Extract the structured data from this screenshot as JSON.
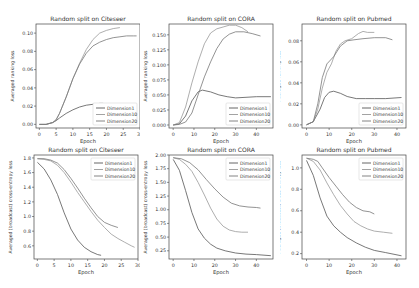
{
  "figure": {
    "line_colors": [
      "#555555",
      "#999999",
      "#777777"
    ]
  },
  "chart_data": [
    {
      "type": "line",
      "title": "Random split on Citeseer",
      "xlabel": "Epoch",
      "ylabel": "Averaged ranking loss",
      "xlim": [
        -1,
        30
      ],
      "ylim": [
        -0.004,
        0.11
      ],
      "xticks": [
        0,
        5,
        10,
        15,
        20,
        25,
        30
      ],
      "yticks": [
        0.0,
        0.02,
        0.04,
        0.06,
        0.08,
        0.1
      ],
      "ytick_labels": [
        "0.00",
        "0.02",
        "0.04",
        "0.06",
        "0.08",
        "0.10"
      ],
      "legend_position": "lower right",
      "series": [
        {
          "name": "Dimension1",
          "x": [
            0,
            2,
            4,
            5,
            6,
            8,
            10,
            12,
            14,
            16,
            18,
            19
          ],
          "y": [
            0,
            0,
            0.002,
            0.004,
            0.007,
            0.012,
            0.016,
            0.019,
            0.021,
            0.022,
            0.023,
            0.023
          ]
        },
        {
          "name": "Dimension10",
          "x": [
            0,
            2,
            4,
            5,
            6,
            8,
            10,
            12,
            14,
            16,
            18,
            20,
            22,
            24
          ],
          "y": [
            0,
            0,
            0.002,
            0.005,
            0.012,
            0.03,
            0.05,
            0.067,
            0.082,
            0.093,
            0.1,
            0.103,
            0.105,
            0.106
          ]
        },
        {
          "name": "Dimension20",
          "x": [
            0,
            2,
            4,
            5,
            6,
            8,
            10,
            12,
            14,
            16,
            18,
            20,
            22,
            24,
            26,
            28,
            29
          ],
          "y": [
            0,
            0,
            0.002,
            0.005,
            0.012,
            0.03,
            0.05,
            0.066,
            0.078,
            0.086,
            0.09,
            0.093,
            0.095,
            0.096,
            0.097,
            0.097,
            0.097
          ]
        }
      ]
    },
    {
      "type": "line",
      "title": "Random split on CORA",
      "xlabel": "Epoch",
      "ylabel": "Averaged ranking loss",
      "xlim": [
        -2,
        48
      ],
      "ylim": [
        -0.005,
        0.168
      ],
      "xticks": [
        0,
        10,
        20,
        30,
        40
      ],
      "yticks": [
        0.0,
        0.025,
        0.05,
        0.075,
        0.1,
        0.125,
        0.15
      ],
      "ytick_labels": [
        "0.000",
        "0.025",
        "0.050",
        "0.075",
        "0.100",
        "0.125",
        "0.150"
      ],
      "legend_position": "lower right",
      "series": [
        {
          "name": "Dimension1",
          "x": [
            0,
            3,
            6,
            9,
            12,
            14,
            18,
            22,
            26,
            30,
            35,
            40,
            47
          ],
          "y": [
            0,
            0.002,
            0.015,
            0.04,
            0.055,
            0.058,
            0.055,
            0.05,
            0.047,
            0.045,
            0.046,
            0.047,
            0.047
          ]
        },
        {
          "name": "Dimension10",
          "x": [
            0,
            3,
            6,
            9,
            12,
            15,
            18,
            21,
            24,
            27,
            30,
            33,
            36
          ],
          "y": [
            0,
            0.004,
            0.03,
            0.07,
            0.105,
            0.135,
            0.153,
            0.16,
            0.163,
            0.166,
            0.166,
            0.162,
            0.155
          ]
        },
        {
          "name": "Dimension20",
          "x": [
            0,
            3,
            6,
            9,
            12,
            15,
            18,
            21,
            24,
            27,
            30,
            34,
            38,
            42
          ],
          "y": [
            0,
            0.001,
            0.005,
            0.02,
            0.05,
            0.08,
            0.105,
            0.127,
            0.143,
            0.151,
            0.155,
            0.155,
            0.152,
            0.148
          ]
        }
      ]
    },
    {
      "type": "line",
      "title": "Random split on Pubmed",
      "xlabel": "Epoch",
      "ylabel": "Averaged ranking loss",
      "xlim": [
        -2,
        44
      ],
      "ylim": [
        -0.003,
        0.096
      ],
      "xticks": [
        0,
        10,
        20,
        30,
        40
      ],
      "yticks": [
        0.0,
        0.02,
        0.04,
        0.06,
        0.08
      ],
      "ytick_labels": [
        "0.00",
        "0.02",
        "0.04",
        "0.06",
        "0.08"
      ],
      "legend_position": "lower right",
      "series": [
        {
          "name": "Dimension1",
          "x": [
            0,
            3,
            6,
            8,
            10,
            12,
            15,
            18,
            22,
            26,
            30,
            35,
            42
          ],
          "y": [
            0,
            0.003,
            0.015,
            0.026,
            0.031,
            0.032,
            0.03,
            0.027,
            0.025,
            0.025,
            0.025,
            0.025,
            0.026
          ]
        },
        {
          "name": "Dimension10",
          "x": [
            0,
            3,
            5,
            7,
            9,
            11,
            13,
            15,
            17,
            20,
            23,
            25,
            27,
            30
          ],
          "y": [
            0,
            0.003,
            0.015,
            0.035,
            0.05,
            0.058,
            0.07,
            0.077,
            0.08,
            0.082,
            0.087,
            0.089,
            0.088,
            0.088
          ]
        },
        {
          "name": "Dimension20",
          "x": [
            0,
            3,
            5,
            7,
            9,
            12,
            15,
            18,
            21,
            25,
            30,
            35,
            38
          ],
          "y": [
            0,
            0.003,
            0.02,
            0.045,
            0.058,
            0.065,
            0.075,
            0.08,
            0.081,
            0.082,
            0.083,
            0.083,
            0.081
          ]
        }
      ]
    },
    {
      "type": "line",
      "title": "Random split on Citeseer",
      "xlabel": "Epoch",
      "ylabel": "Averaged (broadcast) cross-entropy loss",
      "xlim": [
        -1,
        30
      ],
      "ylim": [
        0.42,
        1.84
      ],
      "xticks": [
        0,
        5,
        10,
        15,
        20,
        25,
        30
      ],
      "yticks": [
        0.6,
        0.8,
        1.0,
        1.2,
        1.4,
        1.6,
        1.8
      ],
      "ytick_labels": [
        "0.6",
        "0.8",
        "1.0",
        "1.2",
        "1.4",
        "1.6",
        "1.8"
      ],
      "legend_position": "upper right",
      "series": [
        {
          "name": "Dimension1",
          "x": [
            0,
            2,
            4,
            6,
            8,
            10,
            12,
            14,
            16,
            18,
            19
          ],
          "y": [
            1.74,
            1.65,
            1.5,
            1.3,
            1.05,
            0.83,
            0.68,
            0.58,
            0.52,
            0.48,
            0.47
          ]
        },
        {
          "name": "Dimension10",
          "x": [
            0,
            2,
            4,
            6,
            8,
            10,
            12,
            14,
            16,
            18,
            20,
            22,
            24,
            26,
            28,
            29
          ],
          "y": [
            1.79,
            1.78,
            1.76,
            1.7,
            1.6,
            1.47,
            1.33,
            1.2,
            1.07,
            0.95,
            0.85,
            0.76,
            0.7,
            0.65,
            0.6,
            0.58
          ]
        },
        {
          "name": "Dimension20",
          "x": [
            0,
            2,
            4,
            6,
            8,
            10,
            12,
            14,
            16,
            18,
            20,
            22,
            24
          ],
          "y": [
            1.79,
            1.79,
            1.77,
            1.73,
            1.64,
            1.52,
            1.39,
            1.25,
            1.12,
            1.0,
            0.92,
            0.88,
            0.85
          ]
        }
      ]
    },
    {
      "type": "line",
      "title": "Random split on CORA",
      "xlabel": "Epoch",
      "ylabel": "Averaged (broadcast) cross-entropy loss",
      "xlim": [
        -2,
        48
      ],
      "ylim": [
        0.1,
        2.0
      ],
      "xticks": [
        0,
        10,
        20,
        30,
        40
      ],
      "yticks": [
        0.25,
        0.5,
        0.75,
        1.0,
        1.25,
        1.5,
        1.75,
        2.0
      ],
      "ytick_labels": [
        "0.25",
        "0.50",
        "0.75",
        "1.00",
        "1.25",
        "1.50",
        "1.75",
        "2.00"
      ],
      "legend_position": "upper right",
      "series": [
        {
          "name": "Dimension1",
          "x": [
            0,
            3,
            6,
            9,
            12,
            15,
            18,
            21,
            25,
            30,
            35,
            40,
            47
          ],
          "y": [
            1.92,
            1.72,
            1.35,
            0.95,
            0.65,
            0.48,
            0.37,
            0.3,
            0.25,
            0.21,
            0.19,
            0.18,
            0.16
          ]
        },
        {
          "name": "Dimension10",
          "x": [
            0,
            3,
            6,
            9,
            12,
            15,
            18,
            21,
            24,
            27,
            30,
            33,
            36
          ],
          "y": [
            1.95,
            1.92,
            1.83,
            1.7,
            1.5,
            1.27,
            1.03,
            0.83,
            0.7,
            0.63,
            0.6,
            0.59,
            0.59
          ]
        },
        {
          "name": "Dimension20",
          "x": [
            0,
            4,
            8,
            12,
            16,
            20,
            24,
            28,
            32,
            36,
            40,
            42
          ],
          "y": [
            1.95,
            1.93,
            1.86,
            1.73,
            1.55,
            1.38,
            1.23,
            1.12,
            1.07,
            1.05,
            1.04,
            1.03
          ]
        }
      ]
    },
    {
      "type": "line",
      "title": "Random split on Pubmed",
      "xlabel": "Epoch",
      "ylabel": "Averaged (broadcast) cross-entropy loss",
      "xlim": [
        -2,
        44
      ],
      "ylim": [
        0.15,
        1.12
      ],
      "xticks": [
        0,
        10,
        20,
        30,
        40
      ],
      "yticks": [
        0.2,
        0.4,
        0.6,
        0.8,
        1.0
      ],
      "ytick_labels": [
        "0.2",
        "0.4",
        "0.6",
        "0.8",
        "1.0"
      ],
      "legend_position": "upper right",
      "series": [
        {
          "name": "Dimension1",
          "x": [
            0,
            3,
            6,
            9,
            12,
            15,
            18,
            22,
            26,
            30,
            35,
            42
          ],
          "y": [
            1.07,
            0.93,
            0.72,
            0.55,
            0.46,
            0.4,
            0.35,
            0.3,
            0.26,
            0.23,
            0.21,
            0.18
          ]
        },
        {
          "name": "Dimension10",
          "x": [
            0,
            3,
            6,
            9,
            12,
            15,
            18,
            21,
            24,
            27,
            30,
            34,
            38
          ],
          "y": [
            1.09,
            1.06,
            0.98,
            0.86,
            0.75,
            0.65,
            0.57,
            0.5,
            0.46,
            0.43,
            0.41,
            0.4,
            0.39
          ]
        },
        {
          "name": "Dimension20",
          "x": [
            0,
            3,
            5,
            7,
            10,
            13,
            16,
            19,
            22,
            25,
            28,
            30
          ],
          "y": [
            1.09,
            1.08,
            1.06,
            1.0,
            0.91,
            0.83,
            0.75,
            0.68,
            0.63,
            0.6,
            0.59,
            0.57
          ]
        }
      ]
    }
  ]
}
